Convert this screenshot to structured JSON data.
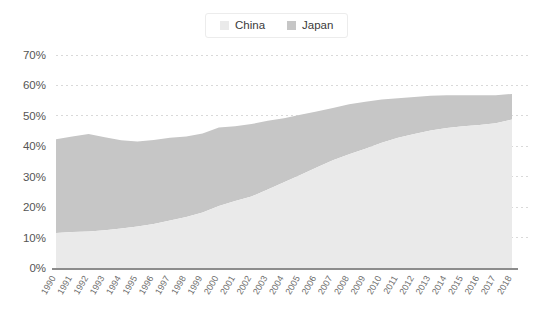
{
  "legend": {
    "position": "top-center",
    "items": [
      {
        "label": "China",
        "color": "#eaeaea",
        "icon": "square-swatch-icon"
      },
      {
        "label": "Japan",
        "color": "#c6c6c6",
        "icon": "square-swatch-icon"
      }
    ]
  },
  "axes": {
    "y_ticks": [
      "0%",
      "10%",
      "20%",
      "30%",
      "40%",
      "50%",
      "60%",
      "70%"
    ],
    "x_ticks": [
      "1990",
      "1991",
      "1992",
      "1993",
      "1994",
      "1995",
      "1996",
      "1997",
      "1998",
      "1999",
      "2000",
      "2001",
      "2002",
      "2003",
      "2004",
      "2005",
      "2006",
      "2007",
      "2008",
      "2009",
      "2010",
      "2011",
      "2012",
      "2013",
      "2014",
      "2015",
      "2016",
      "2017",
      "2018"
    ]
  },
  "colors": {
    "china": "#eaeaea",
    "japan": "#c6c6c6",
    "grid": "#d9d9d9",
    "axis": "#8c8c8c",
    "y_label": "#555555",
    "x_label": "#6d6d6d",
    "background": "#ffffff",
    "legend_border": "#ececec"
  },
  "chart_data": {
    "type": "area",
    "stacked": true,
    "title": "",
    "subtitle": "",
    "xlabel": "",
    "ylabel": "",
    "ylim": [
      0,
      70
    ],
    "yunit": "%",
    "ytick_step": 10,
    "grid": true,
    "legend_position": "top-center",
    "x": [
      "1990",
      "1991",
      "1992",
      "1993",
      "1994",
      "1995",
      "1996",
      "1997",
      "1998",
      "1999",
      "2000",
      "2001",
      "2002",
      "2003",
      "2004",
      "2005",
      "2006",
      "2007",
      "2008",
      "2009",
      "2010",
      "2011",
      "2012",
      "2013",
      "2014",
      "2015",
      "2016",
      "2017",
      "2018"
    ],
    "series": [
      {
        "name": "China",
        "color": "#eaeaea",
        "values": [
          11.5,
          11.8,
          12.0,
          12.4,
          13.0,
          13.6,
          14.5,
          15.6,
          16.8,
          18.2,
          20.4,
          22.0,
          23.5,
          25.8,
          28.2,
          30.6,
          33.0,
          35.4,
          37.4,
          39.2,
          41.2,
          42.8,
          44.0,
          45.2,
          46.0,
          46.6,
          47.0,
          47.6,
          48.8
        ]
      },
      {
        "name": "Japan",
        "color": "#c6c6c6",
        "values": [
          30.8,
          31.4,
          32.0,
          30.6,
          29.0,
          28.0,
          27.6,
          27.2,
          26.4,
          26.0,
          25.8,
          24.6,
          23.8,
          22.6,
          21.0,
          19.8,
          18.4,
          17.2,
          16.4,
          15.4,
          14.2,
          13.0,
          12.2,
          11.4,
          10.8,
          10.2,
          9.8,
          9.2,
          8.4
        ]
      }
    ],
    "totals": [
      42.3,
      43.2,
      44.0,
      43.0,
      42.0,
      41.6,
      42.1,
      42.8,
      43.2,
      44.2,
      46.2,
      46.6,
      47.3,
      48.4,
      49.2,
      50.4,
      51.4,
      52.6,
      53.8,
      54.6,
      55.4,
      55.8,
      56.2,
      56.6,
      56.8,
      56.8,
      56.8,
      56.8,
      57.2
    ]
  }
}
